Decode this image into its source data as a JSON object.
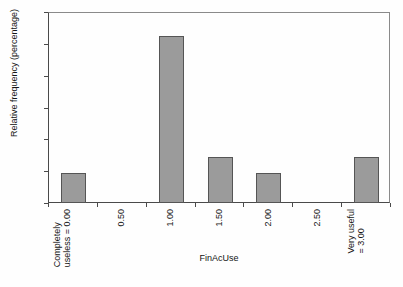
{
  "chart_data": {
    "type": "bar",
    "title": "",
    "xlabel": "FinAcUse",
    "ylabel": "Relative frequency (percentage)",
    "categories": [
      "Completely useless = 0.00",
      "0.50",
      "1.00",
      "1.50",
      "2.00",
      "2.50",
      "Very useful = 3.00"
    ],
    "category_lines": [
      [
        "Completely",
        "useless = 0.00"
      ],
      [
        "0.50",
        ""
      ],
      [
        "1.00",
        ""
      ],
      [
        "1.50",
        ""
      ],
      [
        "2.00",
        ""
      ],
      [
        "2.50",
        ""
      ],
      [
        "Very useful",
        "= 3.00"
      ]
    ],
    "values": [
      9.5,
      0,
      52.4,
      14.3,
      9.5,
      0,
      14.3
    ],
    "ylim": [
      0,
      60
    ],
    "yticks": [
      0,
      10,
      20,
      30,
      40,
      50,
      60
    ],
    "ytick_labels": [
      "0",
      "10",
      "20",
      "30",
      "40",
      "50",
      "60"
    ],
    "grid": false,
    "legend": false,
    "bar_color": "#9b9b9b",
    "bar_border_color": "#555555",
    "axis_color": "#4a4a4a",
    "background_color": "#ffffff"
  }
}
